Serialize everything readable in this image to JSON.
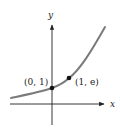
{
  "diagram": {
    "type": "function-graph",
    "function": "y = e^x",
    "axes": {
      "x_label": "x",
      "y_label": "y"
    },
    "points": [
      {
        "label": "(0, 1)",
        "x": 0,
        "y": 1
      },
      {
        "label": "(1, e)",
        "x": 1,
        "y": "e"
      }
    ],
    "colors": {
      "curve": "#7a7a7a",
      "axes": "#222222",
      "points": "#111111",
      "background": "#ffffff"
    }
  }
}
